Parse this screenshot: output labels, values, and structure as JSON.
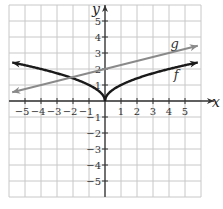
{
  "chart_data": {
    "type": "line",
    "title": "",
    "xlabel": "x",
    "ylabel": "y",
    "xlim": [
      -6,
      6
    ],
    "ylim": [
      -6,
      6
    ],
    "grid": true,
    "x_ticks": [
      "-5",
      "-4",
      "-3",
      "-2",
      "-1",
      "1",
      "2",
      "3",
      "4",
      "5"
    ],
    "y_ticks": [
      "5",
      "4",
      "3",
      "2",
      "1",
      "-1",
      "-2",
      "-3",
      "-4",
      "-5"
    ],
    "series": [
      {
        "name": "f",
        "color": "#1a1a1a",
        "description": "f(x) = sqrt(|x|), arrows on both ends",
        "points": [
          [
            -5.8,
            2.41
          ],
          [
            -5,
            2.24
          ],
          [
            -4,
            2
          ],
          [
            -3,
            1.73
          ],
          [
            -2,
            1.41
          ],
          [
            -1,
            1
          ],
          [
            -0.5,
            0.71
          ],
          [
            0,
            0
          ],
          [
            0.5,
            0.71
          ],
          [
            1,
            1
          ],
          [
            2,
            1.41
          ],
          [
            3,
            1.73
          ],
          [
            4,
            2
          ],
          [
            5,
            2.24
          ],
          [
            5.8,
            2.41
          ]
        ]
      },
      {
        "name": "g",
        "color": "#8a8a8a",
        "description": "straight line, arrows on both ends",
        "points": [
          [
            -5.8,
            0.55
          ],
          [
            0,
            2
          ],
          [
            5.8,
            3.45
          ]
        ]
      }
    ],
    "annotations": [
      {
        "text": "g",
        "x": 4.1,
        "y": 3.3
      },
      {
        "text": "f",
        "x": 4.3,
        "y": 1.4
      }
    ]
  }
}
